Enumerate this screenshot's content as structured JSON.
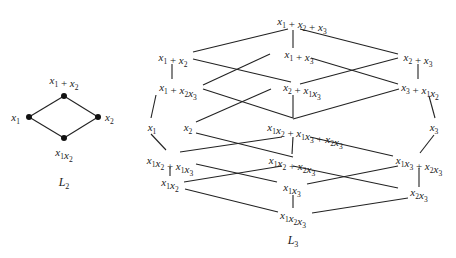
{
  "diagrams": [
    {
      "id": "L2",
      "caption": {
        "base": "L",
        "sub": "2",
        "x": 64,
        "y": 186
      },
      "nodes": [
        {
          "id": "top",
          "x": 64,
          "y": 96,
          "dot": true,
          "label": [
            [
              "x",
              "1"
            ],
            [
              " + ",
              ""
            ],
            [
              "x",
              "2"
            ]
          ],
          "lx": 64,
          "ly": 84,
          "anchor": "middle"
        },
        {
          "id": "left",
          "x": 29,
          "y": 117,
          "dot": true,
          "label": [
            [
              "x",
              "1"
            ]
          ],
          "lx": 20,
          "ly": 121,
          "anchor": "end"
        },
        {
          "id": "right",
          "x": 98,
          "y": 117,
          "dot": true,
          "label": [
            [
              "x",
              "2"
            ]
          ],
          "lx": 105,
          "ly": 121,
          "anchor": "start"
        },
        {
          "id": "bottom",
          "x": 64,
          "y": 138,
          "dot": true,
          "label": [
            [
              "x",
              "1"
            ],
            [
              "x",
              "2"
            ]
          ],
          "lx": 64,
          "ly": 156,
          "anchor": "middle"
        }
      ],
      "edges": [
        {
          "a": [
            64,
            96
          ],
          "b": [
            29,
            117
          ]
        },
        {
          "a": [
            64,
            96
          ],
          "b": [
            98,
            117
          ]
        },
        {
          "a": [
            29,
            117
          ],
          "b": [
            64,
            138
          ]
        },
        {
          "a": [
            98,
            117
          ],
          "b": [
            64,
            138
          ]
        }
      ]
    },
    {
      "id": "L3",
      "caption": {
        "base": "L",
        "sub": "3",
        "x": 293,
        "y": 244
      },
      "nodes": [
        {
          "id": "x1+x2+x3",
          "label": [
            [
              "x",
              "1"
            ],
            [
              " + ",
              ""
            ],
            [
              "x",
              "2"
            ],
            [
              " + ",
              ""
            ],
            [
              "x",
              "3"
            ]
          ],
          "lx": 302,
          "ly": 25,
          "anchor": "middle"
        },
        {
          "id": "x1+x2",
          "label": [
            [
              "x",
              "1"
            ],
            [
              " + ",
              ""
            ],
            [
              "x",
              "2"
            ]
          ],
          "lx": 173,
          "ly": 61,
          "anchor": "middle"
        },
        {
          "id": "x1+x3",
          "label": [
            [
              "x",
              "1"
            ],
            [
              " + ",
              ""
            ],
            [
              "x",
              "3"
            ]
          ],
          "lx": 299,
          "ly": 58,
          "anchor": "middle"
        },
        {
          "id": "x2+x3",
          "label": [
            [
              "x",
              "2"
            ],
            [
              " + ",
              ""
            ],
            [
              "x",
              "3"
            ]
          ],
          "lx": 418,
          "ly": 61,
          "anchor": "middle"
        },
        {
          "id": "x1+x2x3",
          "label": [
            [
              "x",
              "1"
            ],
            [
              " + ",
              ""
            ],
            [
              "x",
              "2"
            ],
            [
              "x",
              "3"
            ]
          ],
          "lx": 178,
          "ly": 91,
          "anchor": "middle"
        },
        {
          "id": "x2+x1x3",
          "label": [
            [
              "x",
              "2"
            ],
            [
              " + ",
              ""
            ],
            [
              "x",
              "1"
            ],
            [
              "x",
              "3"
            ]
          ],
          "lx": 302,
          "ly": 91,
          "anchor": "middle"
        },
        {
          "id": "x3+x1x2",
          "label": [
            [
              "x",
              "3"
            ],
            [
              " + ",
              ""
            ],
            [
              "x",
              "1"
            ],
            [
              "x",
              "2"
            ]
          ],
          "lx": 420,
          "ly": 91,
          "anchor": "middle"
        },
        {
          "id": "x1",
          "label": [
            [
              "x",
              "1"
            ]
          ],
          "lx": 152,
          "ly": 131,
          "anchor": "middle"
        },
        {
          "id": "x2",
          "label": [
            [
              "x",
              "2"
            ]
          ],
          "lx": 188,
          "ly": 131,
          "anchor": "middle"
        },
        {
          "id": "x1x2+x1x3+x2x3",
          "label": [
            [
              "x",
              "1"
            ],
            [
              "x",
              "2"
            ],
            [
              " + ",
              ""
            ],
            [
              "x",
              "1"
            ],
            [
              "x",
              "3"
            ],
            [
              " + ",
              ""
            ],
            [
              "x",
              "2"
            ],
            [
              "x",
              "3"
            ]
          ],
          "lx": 305,
          "ly": 131,
          "anchor": "middle"
        },
        {
          "id": "x3",
          "label": [
            [
              "x",
              "3"
            ]
          ],
          "lx": 434,
          "ly": 131,
          "anchor": "middle"
        },
        {
          "id": "x1x2+x1x3",
          "label": [
            [
              "x",
              "1"
            ],
            [
              "x",
              "2"
            ],
            [
              " + ",
              ""
            ],
            [
              "x",
              "1"
            ],
            [
              "x",
              "3"
            ]
          ],
          "lx": 170,
          "ly": 164,
          "anchor": "middle"
        },
        {
          "id": "x1x2+x2x3",
          "label": [
            [
              "x",
              "1"
            ],
            [
              "x",
              "2"
            ],
            [
              " + ",
              ""
            ],
            [
              "x",
              "2"
            ],
            [
              "x",
              "3"
            ]
          ],
          "lx": 292,
          "ly": 164,
          "anchor": "middle"
        },
        {
          "id": "x1x3+x2x3",
          "label": [
            [
              "x",
              "1"
            ],
            [
              "x",
              "3"
            ],
            [
              " + ",
              ""
            ],
            [
              "x",
              "2"
            ],
            [
              "x",
              "3"
            ]
          ],
          "lx": 419,
          "ly": 164,
          "anchor": "middle"
        },
        {
          "id": "x1x2",
          "label": [
            [
              "x",
              "1"
            ],
            [
              "x",
              "2"
            ]
          ],
          "lx": 170,
          "ly": 186,
          "anchor": "middle"
        },
        {
          "id": "x1x3",
          "label": [
            [
              "x",
              "1"
            ],
            [
              "x",
              "3"
            ]
          ],
          "lx": 292,
          "ly": 191,
          "anchor": "middle"
        },
        {
          "id": "x2x3",
          "label": [
            [
              "x",
              "2"
            ],
            [
              "x",
              "3"
            ]
          ],
          "lx": 419,
          "ly": 196,
          "anchor": "middle"
        },
        {
          "id": "x1x2x3",
          "label": [
            [
              "x",
              "1"
            ],
            [
              "x",
              "2"
            ],
            [
              "x",
              "3"
            ]
          ],
          "lx": 293,
          "ly": 219,
          "anchor": "middle"
        }
      ],
      "edges": [
        {
          "a": [
            288,
            29
          ],
          "b": [
            193,
            52
          ]
        },
        {
          "a": [
            293,
            30
          ],
          "b": [
            293,
            48
          ]
        },
        {
          "a": [
            300,
            29
          ],
          "b": [
            398,
            54
          ]
        },
        {
          "a": [
            172,
            64
          ],
          "b": [
            172,
            79
          ]
        },
        {
          "a": [
            193,
            59
          ],
          "b": [
            291,
            82
          ]
        },
        {
          "a": [
            270,
            54
          ],
          "b": [
            203,
            85
          ]
        },
        {
          "a": [
            311,
            58
          ],
          "b": [
            398,
            84
          ]
        },
        {
          "a": [
            398,
            58
          ],
          "b": [
            300,
            84
          ]
        },
        {
          "a": [
            418,
            64
          ],
          "b": [
            418,
            79
          ]
        },
        {
          "a": [
            156,
            95
          ],
          "b": [
            151,
            118
          ]
        },
        {
          "a": [
            203,
            89
          ],
          "b": [
            293,
            118
          ]
        },
        {
          "a": [
            271,
            89
          ],
          "b": [
            196,
            122
          ]
        },
        {
          "a": [
            293,
            95
          ],
          "b": [
            293,
            118
          ]
        },
        {
          "a": [
            399,
            89
          ],
          "b": [
            293,
            119
          ]
        },
        {
          "a": [
            429,
            96
          ],
          "b": [
            435,
            118
          ]
        },
        {
          "a": [
            151,
            134
          ],
          "b": [
            166,
            150
          ]
        },
        {
          "a": [
            196,
            133
          ],
          "b": [
            293,
            157
          ]
        },
        {
          "a": [
            293,
            137
          ],
          "b": [
            292,
            154
          ]
        },
        {
          "a": [
            282,
            137
          ],
          "b": [
            180,
            152
          ]
        },
        {
          "a": [
            310,
            137
          ],
          "b": [
            393,
            156
          ]
        },
        {
          "a": [
            434,
            135
          ],
          "b": [
            420,
            153
          ]
        },
        {
          "a": [
            170,
            167
          ],
          "b": [
            170,
            176
          ]
        },
        {
          "a": [
            196,
            164
          ],
          "b": [
            277,
            182
          ]
        },
        {
          "a": [
            184,
            182
          ],
          "b": [
            282,
            166
          ]
        },
        {
          "a": [
            293,
            166
          ],
          "b": [
            398,
            188
          ]
        },
        {
          "a": [
            307,
            184
          ],
          "b": [
            398,
            166
          ]
        },
        {
          "a": [
            419,
            168
          ],
          "b": [
            419,
            187
          ]
        },
        {
          "a": [
            185,
            189
          ],
          "b": [
            278,
            212
          ]
        },
        {
          "a": [
            293,
            195
          ],
          "b": [
            293,
            208
          ]
        },
        {
          "a": [
            312,
            213
          ],
          "b": [
            408,
            198
          ]
        }
      ]
    }
  ]
}
